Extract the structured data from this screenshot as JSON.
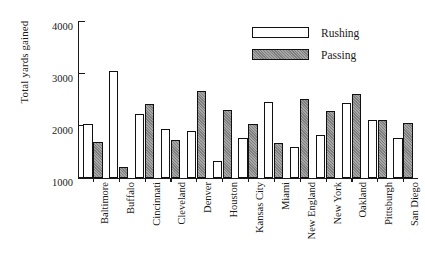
{
  "chart_data": {
    "type": "bar",
    "title": "",
    "xlabel": "",
    "ylabel": "Total yards gained",
    "ylim": [
      1000,
      4000
    ],
    "yticks": [
      1000,
      2000,
      3000,
      4000
    ],
    "ytick_labels": [
      "1000",
      "2000",
      "3000",
      "4000"
    ],
    "grid": false,
    "legend_position": "top-right",
    "orientation": "vertical",
    "grouping": "grouped",
    "categories": [
      "Baltimore",
      "Buffalo",
      "Cincinnati",
      "Cleveland",
      "Denver",
      "Houston",
      "Kansas City",
      "Miami",
      "New England",
      "New York",
      "Oakland",
      "Pittsburgh",
      "San Diego"
    ],
    "series": [
      {
        "name": "Rushing",
        "color": "#ffffff",
        "values": [
          2040,
          3050,
          2230,
          1940,
          1910,
          1320,
          1760,
          2470,
          1590,
          1830,
          2450,
          2110,
          1770
        ]
      },
      {
        "name": "Passing",
        "color": "#8d8d8d",
        "values": [
          1690,
          1220,
          2430,
          1740,
          2670,
          2310,
          2030,
          1670,
          2510,
          2290,
          2610,
          2110,
          2060
        ]
      }
    ]
  },
  "legend": {
    "items": [
      {
        "label": "Rushing",
        "swatch": "white-bar-swatch"
      },
      {
        "label": "Passing",
        "swatch": "gray-bar-swatch"
      }
    ]
  },
  "axis": {
    "y_title": "Total yards gained"
  }
}
